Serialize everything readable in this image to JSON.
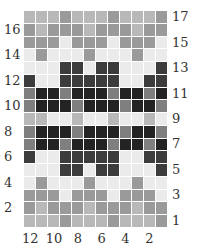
{
  "chart_data": {
    "type": "heatmap",
    "title": "",
    "columns": 12,
    "rows": 17,
    "column_labels": [
      "12",
      "10",
      "8",
      "6",
      "4",
      "2"
    ],
    "column_label_positions": [
      12,
      10,
      8,
      6,
      4,
      2
    ],
    "row_labels_left": [
      "16",
      "14",
      "12",
      "10",
      "8",
      "6",
      "4",
      "2"
    ],
    "row_labels_right": [
      "17",
      "15",
      "13",
      "11",
      "9",
      "7",
      "5",
      "3",
      "1"
    ],
    "shade_palette": [
      "#ebebeb",
      "#b8b8b8",
      "#9a9a9a",
      "#7f7f7f",
      "#3c3c3c",
      "#232323"
    ],
    "grid_top_to_bottom": [
      [
        1,
        1,
        1,
        2,
        1,
        1,
        1,
        2,
        1,
        1,
        1,
        2
      ],
      [
        2,
        1,
        2,
        2,
        2,
        1,
        2,
        2,
        2,
        1,
        2,
        2
      ],
      [
        2,
        2,
        2,
        0,
        2,
        2,
        2,
        0,
        2,
        2,
        2,
        0
      ],
      [
        0,
        2,
        0,
        0,
        0,
        2,
        0,
        0,
        0,
        2,
        0,
        0
      ],
      [
        0,
        0,
        0,
        4,
        4,
        0,
        4,
        4,
        0,
        0,
        0,
        4
      ],
      [
        4,
        0,
        0,
        4,
        4,
        4,
        4,
        4,
        0,
        0,
        4,
        4
      ],
      [
        3,
        5,
        5,
        3,
        5,
        5,
        5,
        3,
        5,
        5,
        3,
        5
      ],
      [
        3,
        5,
        5,
        5,
        3,
        5,
        5,
        5,
        3,
        5,
        5,
        3
      ],
      [
        1,
        1,
        0,
        0,
        1,
        0,
        0,
        1,
        0,
        0,
        1,
        0
      ],
      [
        3,
        5,
        5,
        5,
        3,
        5,
        5,
        5,
        3,
        5,
        5,
        3
      ],
      [
        3,
        5,
        5,
        3,
        5,
        5,
        5,
        3,
        5,
        5,
        3,
        5
      ],
      [
        4,
        0,
        0,
        4,
        4,
        4,
        4,
        4,
        0,
        0,
        4,
        4
      ],
      [
        0,
        0,
        0,
        4,
        4,
        0,
        4,
        4,
        0,
        0,
        0,
        4
      ],
      [
        0,
        2,
        0,
        0,
        0,
        2,
        0,
        0,
        0,
        2,
        0,
        0
      ],
      [
        2,
        2,
        2,
        0,
        2,
        2,
        2,
        0,
        2,
        2,
        2,
        0
      ],
      [
        2,
        1,
        2,
        2,
        2,
        1,
        2,
        2,
        2,
        1,
        2,
        2
      ],
      [
        1,
        1,
        1,
        2,
        1,
        1,
        1,
        2,
        1,
        1,
        1,
        2
      ]
    ]
  },
  "labels": {
    "left": [
      {
        "text": "16",
        "row": 16
      },
      {
        "text": "14",
        "row": 14
      },
      {
        "text": "12",
        "row": 12
      },
      {
        "text": "10",
        "row": 10
      },
      {
        "text": "8",
        "row": 8
      },
      {
        "text": "6",
        "row": 6
      },
      {
        "text": "4",
        "row": 4
      },
      {
        "text": "2",
        "row": 2
      }
    ],
    "right": [
      {
        "text": "17",
        "row": 17
      },
      {
        "text": "15",
        "row": 15
      },
      {
        "text": "13",
        "row": 13
      },
      {
        "text": "11",
        "row": 11
      },
      {
        "text": "9",
        "row": 9
      },
      {
        "text": "7",
        "row": 7
      },
      {
        "text": "5",
        "row": 5
      },
      {
        "text": "3",
        "row": 3
      },
      {
        "text": "1",
        "row": 1
      }
    ],
    "bottom": [
      {
        "text": "12",
        "col": 12
      },
      {
        "text": "10",
        "col": 10
      },
      {
        "text": "8",
        "col": 8
      },
      {
        "text": "6",
        "col": 6
      },
      {
        "text": "4",
        "col": 4
      },
      {
        "text": "2",
        "col": 2
      }
    ]
  }
}
